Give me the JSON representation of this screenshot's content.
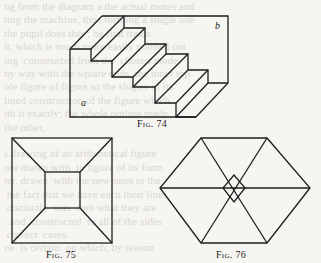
{
  "page": {
    "background_color": "#f6f5f2",
    "ink_color": "#1e1e1e",
    "bleed_color": "#d9d7d2"
  },
  "bleed_through_text": "show-through text from the reverse side of the page (illegible)",
  "figures": [
    {
      "id": "fig74",
      "caption": "Fig. 74",
      "description": "Isometric view of a staircase block with four steps descending from back-left to front-right",
      "labels": [
        {
          "text": "a",
          "position": "lower-left of front face"
        },
        {
          "text": "b",
          "position": "upper-right of back face"
        }
      ]
    },
    {
      "id": "fig75",
      "caption": "Fig. 75",
      "description": "Square with a smaller centered square, corners joined by diagonals (truncated pyramid seen from above)"
    },
    {
      "id": "fig76",
      "caption": "Fig. 76",
      "description": "Hexagon with three long diagonals forming a small central diamond"
    }
  ]
}
